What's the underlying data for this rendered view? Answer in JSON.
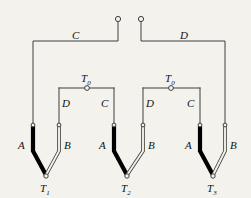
{
  "figure": {
    "background_color": "#f4f2ed",
    "line_color": "#3f3f3f",
    "conductor_a_color": "#000000",
    "conductor_b_color": "#ffffff",
    "text_color": "#111111"
  },
  "bus_labels": {
    "left": "C",
    "right": "D"
  },
  "terminals": [
    {
      "name": "terminal-left",
      "x": 118,
      "y": 19
    },
    {
      "name": "terminal-right",
      "x": 141,
      "y": 19
    }
  ],
  "bridges": [
    {
      "node_label": "T",
      "node_subscript": "0",
      "left_leg_label": "D",
      "right_leg_label": "C"
    },
    {
      "node_label": "T",
      "node_subscript": "0",
      "left_leg_label": "D",
      "right_leg_label": "C"
    }
  ],
  "thermocouples": [
    {
      "junction_label": "T",
      "junction_subscript": "1",
      "left_leg_label": "A",
      "right_leg_label": "B"
    },
    {
      "junction_label": "T",
      "junction_subscript": "2",
      "left_leg_label": "A",
      "right_leg_label": "B"
    },
    {
      "junction_label": "T",
      "junction_subscript": "3",
      "left_leg_label": "A",
      "right_leg_label": "B"
    }
  ]
}
